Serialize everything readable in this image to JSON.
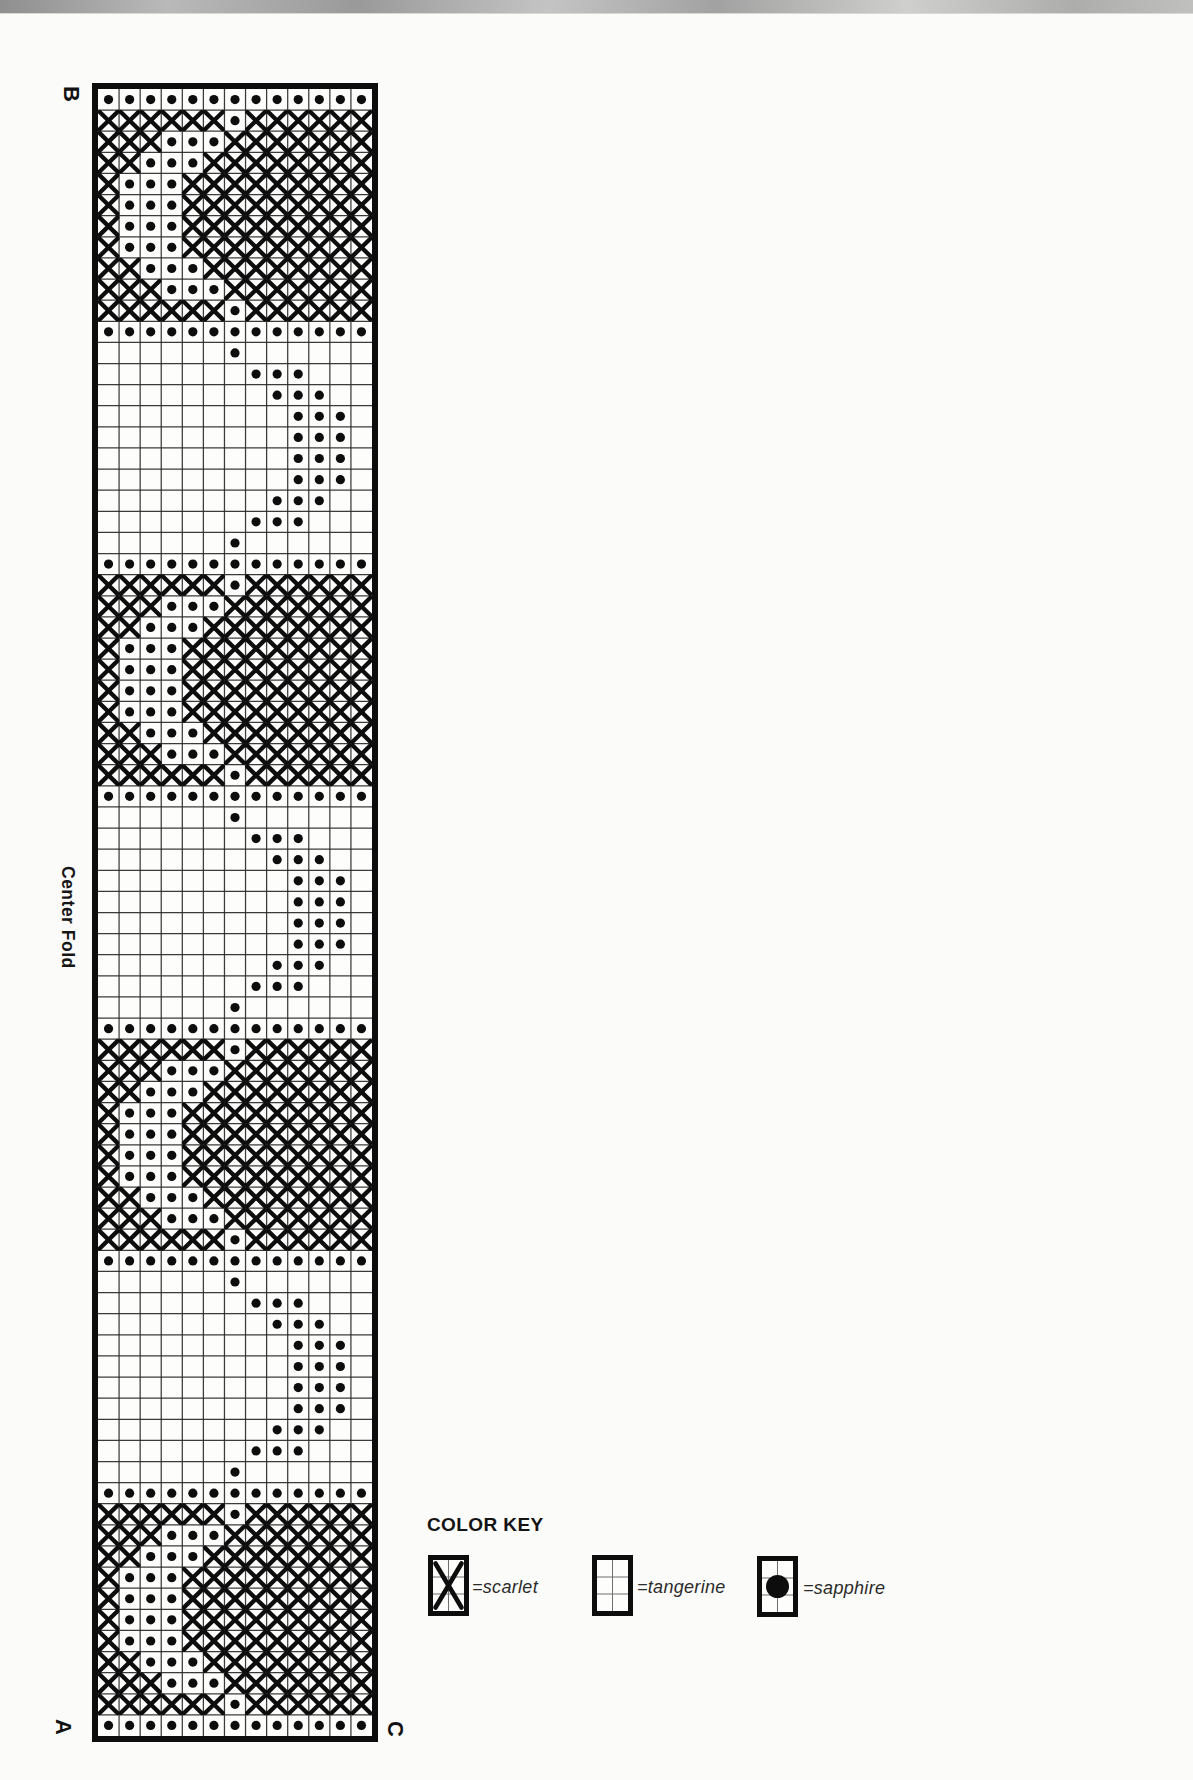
{
  "page": {
    "type": "scanned needlework chart page",
    "colors": {
      "ink": "#0d0d0d",
      "paper": "#fbfbf9",
      "gridline": "#2b2b2b",
      "scan_edge": "#a5a5a5"
    }
  },
  "chart": {
    "corner_labels": {
      "top_left": "B",
      "bottom_left": "A",
      "bottom_right": "C"
    },
    "side_label": "Center Fold",
    "legend_title": "COLOR KEY",
    "legend": [
      {
        "swatch": "x-cross",
        "label": "=scarlet",
        "color_name": "scarlet"
      },
      {
        "swatch": "empty-grid",
        "label": "=tangerine",
        "color_name": "tangerine"
      },
      {
        "swatch": "dot",
        "label": "=sapphire",
        "color_name": "sapphire"
      }
    ],
    "symbols": {
      "X": "scarlet cross-stitch",
      "O": "sapphire dot stitch",
      ".": "tangerine (blank square)"
    },
    "columns": 13,
    "rows": 78,
    "grid_rows": [
      "OOOOOOOOOOOOO",
      "XXXXXXOXXXXXX",
      "XXXOOOXXXXXXX",
      "XXOOOXXXXXXXX",
      "XOOOXXXXXXXXX",
      "XOOOXXXXXXXXX",
      "XOOOXXXXXXXXX",
      "XOOOXXXXXXXXX",
      "XXOOOXXXXXXXX",
      "XXXOOOXXXXXXX",
      "XXXXXXOXXXXXX",
      "OOOOOOOOOOOOO",
      "......O......",
      ".......OOO...",
      "........OOO..",
      ".........OOO.",
      ".........OOO.",
      ".........OOO.",
      ".........OOO.",
      "........OOO..",
      ".......OOO...",
      "......O......",
      "OOOOOOOOOOOOO",
      "XXXXXXOXXXXXX",
      "XXXOOOXXXXXXX",
      "XXOOOXXXXXXXX",
      "XOOOXXXXXXXXX",
      "XOOOXXXXXXXXX",
      "XOOOXXXXXXXXX",
      "XOOOXXXXXXXXX",
      "XXOOOXXXXXXXX",
      "XXXOOOXXXXXXX",
      "XXXXXXOXXXXXX",
      "OOOOOOOOOOOOO",
      "......O......",
      ".......OOO...",
      "........OOO..",
      ".........OOO.",
      ".........OOO.",
      ".........OOO.",
      ".........OOO.",
      "........OOO..",
      ".......OOO...",
      "......O......",
      "OOOOOOOOOOOOO",
      "XXXXXXOXXXXXX",
      "XXXOOOXXXXXXX",
      "XXOOOXXXXXXXX",
      "XOOOXXXXXXXXX",
      "XOOOXXXXXXXXX",
      "XOOOXXXXXXXXX",
      "XOOOXXXXXXXXX",
      "XXOOOXXXXXXXX",
      "XXXOOOXXXXXXX",
      "XXXXXXOXXXXXX",
      "OOOOOOOOOOOOO",
      "......O......",
      ".......OOO...",
      "........OOO..",
      ".........OOO.",
      ".........OOO.",
      ".........OOO.",
      ".........OOO.",
      "........OOO..",
      ".......OOO...",
      "......O......",
      "OOOOOOOOOOOOO",
      "XXXXXXOXXXXXX",
      "XXXOOOXXXXXXX",
      "XXOOOXXXXXXXX",
      "XOOOXXXXXXXXX",
      "XOOOXXXXXXXXX",
      "XOOOXXXXXXXXX",
      "XOOOXXXXXXXXX",
      "XXOOOXXXXXXXX",
      "XXXOOOXXXXXXX",
      "XXXXXXOXXXXXX",
      "OOOOOOOOOOOOO"
    ]
  }
}
